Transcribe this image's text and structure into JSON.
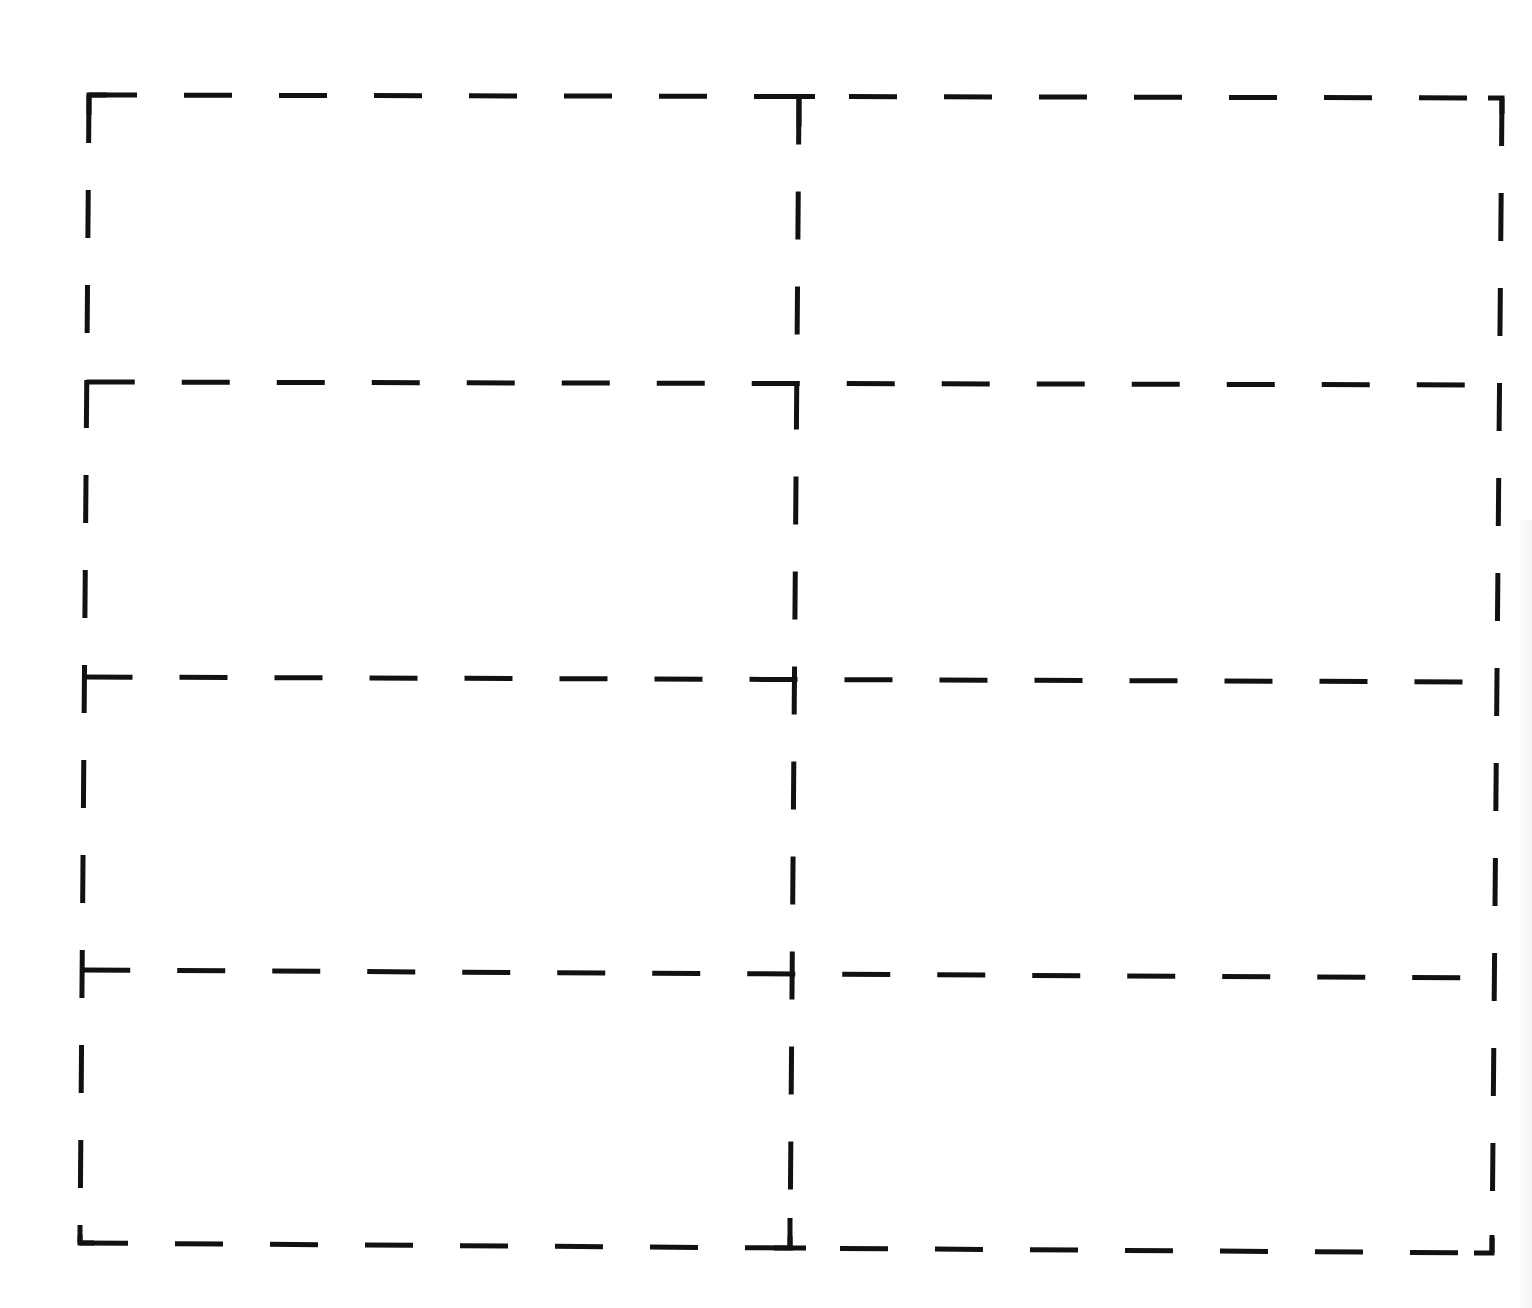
{
  "page": {
    "type": "dashed cut-line label template",
    "columns": 2,
    "rows": 4,
    "line_color": "#111111",
    "background": "#ffffff"
  },
  "grid": {
    "corners": {
      "top_left": [
        89,
        95
      ],
      "top_right": [
        1502,
        98
      ],
      "bottom_left": [
        80,
        1243
      ],
      "bottom_right": [
        1492,
        1253
      ]
    },
    "row_lines_y_left": [
      95,
      382,
      677,
      970,
      1243
    ],
    "row_lines_y_right": [
      98,
      385,
      682,
      978,
      1253
    ],
    "column_line_x_top": 799,
    "column_line_x_bottom": 790
  },
  "cells": [
    {
      "id": "r1c1",
      "text": ""
    },
    {
      "id": "r1c2",
      "text": ""
    },
    {
      "id": "r2c1",
      "text": ""
    },
    {
      "id": "r2c2",
      "text": ""
    },
    {
      "id": "r3c1",
      "text": ""
    },
    {
      "id": "r3c2",
      "text": ""
    },
    {
      "id": "r4c1",
      "text": ""
    },
    {
      "id": "r4c2",
      "text": ""
    }
  ]
}
